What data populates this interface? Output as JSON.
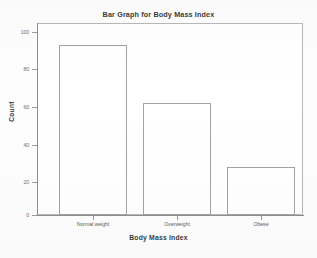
{
  "chart_data": {
    "type": "bar",
    "title": "Bar Graph for Body Mass Index",
    "xlabel": "Body Mass Index",
    "ylabel": "Count",
    "categories": [
      "Normal weight",
      "Overweight",
      "Obese"
    ],
    "values": [
      93,
      61,
      26
    ],
    "ylim": [
      0,
      100
    ],
    "yticks": [
      0,
      20,
      40,
      60,
      80,
      100
    ],
    "ytick_labels": [
      "0",
      "20",
      "40",
      "60",
      "80",
      "100"
    ],
    "grid": false,
    "legend": false,
    "legend_position": "none",
    "bar_fill_color": "#ffffff",
    "bar_edge_color": "#a3a3a3",
    "frame_color": "#b8b8b8",
    "axis_color": "#8f8f8f",
    "text_color": "#3a3a3a"
  }
}
